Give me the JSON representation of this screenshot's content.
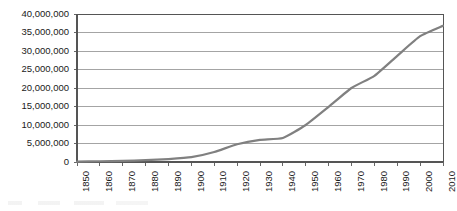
{
  "chart_data": {
    "type": "line",
    "title": "",
    "subtitle": "",
    "xlabel": "",
    "ylabel": "",
    "x": [
      1850,
      1860,
      1870,
      1880,
      1890,
      1900,
      1910,
      1920,
      1930,
      1940,
      1950,
      1960,
      1970,
      1980,
      1990,
      2000,
      2010
    ],
    "categories": [
      "1850",
      "1860",
      "1870",
      "1880",
      "1890",
      "1900",
      "1910",
      "1920",
      "1930",
      "1940",
      "1950",
      "1960",
      "1970",
      "1980",
      "1990",
      "2000",
      "2010"
    ],
    "values": [
      100000,
      200000,
      300000,
      500000,
      800000,
      1300000,
      2700000,
      4800000,
      6000000,
      6500000,
      10000000,
      14900000,
      20000000,
      23300000,
      28700000,
      34000000,
      36800000
    ],
    "series": [
      {
        "name": "Population",
        "values": [
          100000,
          200000,
          300000,
          500000,
          800000,
          1300000,
          2700000,
          4800000,
          6000000,
          6500000,
          10000000,
          14900000,
          20000000,
          23300000,
          28700000,
          34000000,
          36800000
        ]
      }
    ],
    "xlim": [
      1850,
      2010
    ],
    "ylim": [
      0,
      40000000
    ],
    "ytick_values": [
      0,
      5000000,
      10000000,
      15000000,
      20000000,
      25000000,
      30000000,
      35000000,
      40000000
    ],
    "ytick_labels": [
      "0",
      "5,000,000",
      "10,000,000",
      "15,000,000",
      "20,000,000",
      "25,000,000",
      "30,000,000",
      "35,000,000",
      "40,000,000"
    ],
    "grid": true,
    "grid_axis": "y",
    "legend": false,
    "legend_position": "none",
    "markers": false,
    "annotations": [],
    "colors": {
      "line": "#808080",
      "grid": "#9a9a9a",
      "frame": "#555555",
      "axis_text": "#1a1a1a",
      "plot_background": "#ffffff",
      "page_background": "#ffffff"
    },
    "line_width": 2.2
  },
  "plot_geometry": {
    "left": 77,
    "right": 443,
    "top": 14,
    "bottom": 162
  }
}
